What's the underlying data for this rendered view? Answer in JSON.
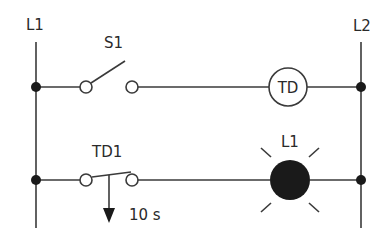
{
  "diagram": {
    "type": "ladder-logic",
    "rails": {
      "left": {
        "label": "L1"
      },
      "right": {
        "label": "L2"
      }
    },
    "rungs": [
      {
        "index": 1,
        "contact": {
          "label": "S1",
          "type": "normally-open switch"
        },
        "output": {
          "label": "TD",
          "type": "timer coil"
        }
      },
      {
        "index": 2,
        "contact": {
          "label": "TD1",
          "type": "timed contact (on-delay, closes after delay)"
        },
        "delay": {
          "label": "10 s"
        },
        "output": {
          "label": "L1",
          "type": "lamp (lit)"
        }
      }
    ]
  },
  "colors": {
    "line": "#3a3a3a",
    "dot": "#1a1a1a",
    "lamp": "#1a1a1a",
    "background": "#ffffff"
  }
}
